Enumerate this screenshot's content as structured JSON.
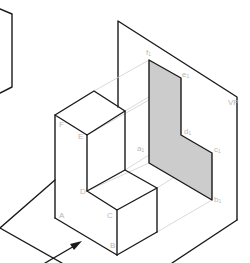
{
  "figure": {
    "type": "orthographic-projection-isometric",
    "plane_label": "VP",
    "colors": {
      "edge": "#1a1a1a",
      "projector": "#cfcfcf",
      "projection_fill": "#cccccc",
      "label": "#b8b8b8"
    },
    "object_vertices": [
      "A",
      "B",
      "C",
      "D",
      "E",
      "F"
    ],
    "projection_vertices": [
      "f₁",
      "e₁",
      "d₁",
      "c₁",
      "b₁",
      "a₁"
    ],
    "labels": {
      "A": "A",
      "B": "B",
      "C": "C",
      "D": "D",
      "E": "E",
      "F": "F",
      "f1": "f₁",
      "e1": "e₁",
      "d1": "d₁",
      "c1": "c₁",
      "b1": "b₁",
      "a1": "a₁",
      "vp": "VP"
    },
    "arrow": "viewing-direction-arrow"
  }
}
